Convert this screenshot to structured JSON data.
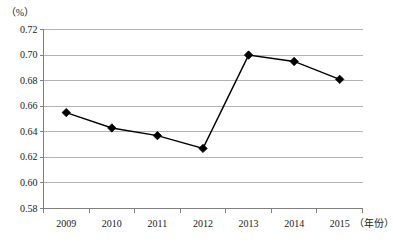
{
  "chart_data": {
    "type": "line",
    "title": "",
    "subtitle": "",
    "xlabel": "（年份）",
    "ylabel": "（%）",
    "categories": [
      "2009",
      "2010",
      "2011",
      "2012",
      "2013",
      "2014",
      "2015"
    ],
    "series": [
      {
        "name": "",
        "values": [
          0.655,
          0.643,
          0.637,
          0.627,
          0.7,
          0.695,
          0.681
        ]
      }
    ],
    "ylim": [
      0.58,
      0.72
    ],
    "ytick_step": 0.02,
    "ytick_labels": [
      "0.58",
      "0.60",
      "0.62",
      "0.64",
      "0.66",
      "0.68",
      "0.70",
      "0.72"
    ],
    "ytick_values": [
      0.58,
      0.6,
      0.62,
      0.64,
      0.66,
      0.68,
      0.7,
      0.72
    ],
    "grid": "horizontal",
    "legend": "none",
    "marker": "diamond",
    "line_color": "#000000",
    "marker_color": "#000000",
    "grid_color": "#b3b3b3",
    "axis_color": "#808080",
    "background": "#ffffff"
  },
  "axes": {
    "y_unit": "（%）",
    "x_unit": "（年份）"
  }
}
